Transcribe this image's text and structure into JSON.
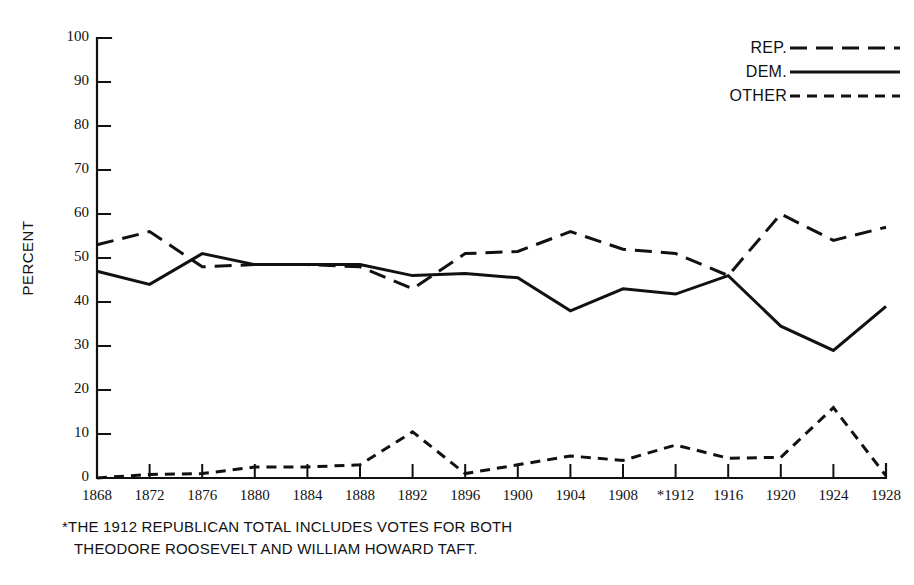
{
  "chart_data": {
    "type": "line",
    "title": "",
    "xlabel": "",
    "ylabel": "PERCENT",
    "ylim": [
      0,
      100
    ],
    "ytick_values": [
      0,
      10,
      20,
      30,
      40,
      50,
      60,
      70,
      80,
      90,
      100
    ],
    "ytick_labels": [
      "0",
      "10",
      "20",
      "30",
      "40",
      "50",
      "60",
      "70",
      "80",
      "90",
      "100"
    ],
    "grid": false,
    "legend_position": "top-right",
    "x": [
      1868,
      1872,
      1876,
      1880,
      1884,
      1888,
      1892,
      1896,
      1900,
      1904,
      1908,
      1912,
      1916,
      1920,
      1924,
      1928
    ],
    "categories": [
      "1868",
      "1872",
      "1876",
      "1880",
      "1884",
      "1888",
      "1892",
      "1896",
      "1900",
      "1904",
      "1908",
      "*1912",
      "1916",
      "1920",
      "1924",
      "1928"
    ],
    "series": [
      {
        "name": "REP.",
        "style": "long-dash",
        "values": [
          53,
          56,
          48,
          48.5,
          48.5,
          48,
          43,
          51,
          51.5,
          56,
          52,
          51,
          46,
          60,
          54,
          57
        ]
      },
      {
        "name": "DEM.",
        "style": "solid",
        "values": [
          47,
          44,
          51,
          48.5,
          48.5,
          48.5,
          46,
          46.5,
          45.5,
          38,
          43,
          41.8,
          46,
          34.5,
          29,
          39
        ]
      },
      {
        "name": "OTHER",
        "style": "short-dash",
        "values": [
          0,
          0.8,
          1,
          2.5,
          2.5,
          3,
          10.5,
          1,
          3,
          5,
          4,
          7.5,
          4.5,
          4.7,
          16,
          0.5
        ]
      }
    ]
  },
  "axis": {
    "y_title": "PERCENT"
  },
  "legend": {
    "entries": [
      {
        "label": "REP."
      },
      {
        "label": "DEM."
      },
      {
        "label": "OTHER"
      }
    ]
  },
  "footnote": {
    "line1": "*THE 1912 REPUBLICAN TOTAL INCLUDES VOTES FOR BOTH",
    "line2": "THEODORE ROOSEVELT AND WILLIAM HOWARD TAFT."
  },
  "colors": {
    "ink": "#111111",
    "background": "#ffffff"
  }
}
